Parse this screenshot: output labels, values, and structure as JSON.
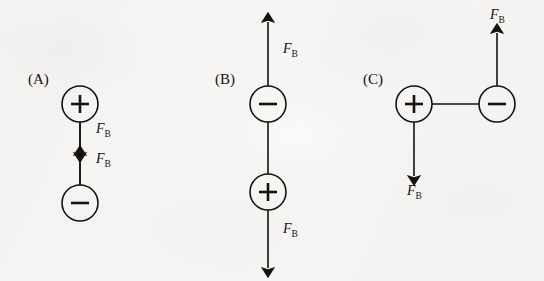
{
  "figure": {
    "background_color": "#f6f5f3",
    "ink_color": "#15120f",
    "width": 544,
    "height": 281
  },
  "force_label": {
    "symbol": "F",
    "subscript": "B"
  },
  "panels": [
    {
      "id": "panel-a",
      "label": "(A)",
      "label_x": 28,
      "label_y": 72,
      "orientation": "vertical",
      "charges": [
        {
          "sign": "+",
          "glyph": "+",
          "cx": 80,
          "cy": 104,
          "r": 18
        },
        {
          "sign": "-",
          "glyph": "−",
          "cx": 80,
          "cy": 203,
          "r": 18
        }
      ],
      "connector": {
        "x1": 80,
        "y1": 122,
        "x2": 80,
        "y2": 185
      },
      "arrows": [
        {
          "name": "force-arrow-down-from-plus",
          "direction": "down",
          "x1": 80,
          "y1": 122,
          "x2": 80,
          "y2": 153,
          "label_x": 96,
          "label_y": 122
        },
        {
          "name": "force-arrow-up-from-minus",
          "direction": "up",
          "x1": 80,
          "y1": 185,
          "x2": 80,
          "y2": 155,
          "label_x": 96,
          "label_y": 152
        }
      ]
    },
    {
      "id": "panel-b",
      "label": "(B)",
      "label_x": 215,
      "label_y": 72,
      "orientation": "vertical",
      "charges": [
        {
          "sign": "-",
          "glyph": "−",
          "cx": 268,
          "cy": 104,
          "r": 18
        },
        {
          "sign": "+",
          "glyph": "+",
          "cx": 268,
          "cy": 192,
          "r": 18
        }
      ],
      "connector": {
        "x1": 268,
        "y1": 122,
        "x2": 268,
        "y2": 174
      },
      "arrows": [
        {
          "name": "force-arrow-up-from-minus",
          "direction": "up",
          "x1": 268,
          "y1": 86,
          "x2": 268,
          "y2": 22,
          "label_x": 283,
          "label_y": 42
        },
        {
          "name": "force-arrow-down-from-plus",
          "direction": "down",
          "x1": 268,
          "y1": 210,
          "x2": 268,
          "y2": 268,
          "label_x": 283,
          "label_y": 222
        }
      ]
    },
    {
      "id": "panel-c",
      "label": "(C)",
      "label_x": 363,
      "label_y": 72,
      "orientation": "horizontal",
      "charges": [
        {
          "sign": "+",
          "glyph": "+",
          "cx": 414,
          "cy": 104,
          "r": 18
        },
        {
          "sign": "-",
          "glyph": "−",
          "cx": 497,
          "cy": 104,
          "r": 18
        }
      ],
      "connector": {
        "x1": 432,
        "y1": 104,
        "x2": 479,
        "y2": 104
      },
      "arrows": [
        {
          "name": "force-arrow-down-from-plus",
          "direction": "down",
          "x1": 414,
          "y1": 122,
          "x2": 414,
          "y2": 176,
          "label_x": 407,
          "label_y": 184
        },
        {
          "name": "force-arrow-up-from-minus",
          "direction": "up",
          "x1": 497,
          "y1": 86,
          "x2": 497,
          "y2": 33,
          "label_x": 490,
          "label_y": 8
        }
      ]
    }
  ]
}
